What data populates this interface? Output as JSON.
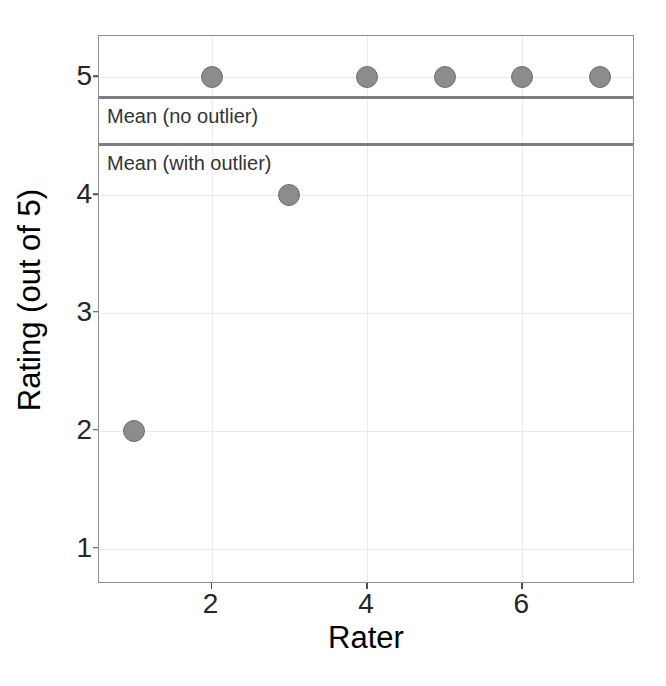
{
  "chart_data": {
    "type": "scatter",
    "title": "",
    "xlabel": "Rater",
    "ylabel": "Rating (out of 5)",
    "x": [
      1,
      2,
      3,
      4,
      5,
      6,
      7
    ],
    "values": [
      2,
      5,
      4,
      5,
      5,
      5,
      5
    ],
    "series": [
      {
        "name": "Ratings",
        "x": [
          1,
          2,
          3,
          4,
          5,
          6,
          7
        ],
        "values": [
          2,
          5,
          4,
          5,
          5,
          5,
          5
        ]
      }
    ],
    "xlim": [
      0.55,
      7.45
    ],
    "ylim": [
      0.7,
      5.35
    ],
    "xticks": [
      2,
      4,
      6
    ],
    "xtick_labels": [
      "2",
      "4",
      "6"
    ],
    "yticks": [
      1,
      2,
      3,
      4,
      5
    ],
    "ytick_labels": [
      "1",
      "2",
      "3",
      "4",
      "5"
    ],
    "grid": true,
    "legend": "none",
    "point_color": "#8c8c8c",
    "point_stroke": "#6e6e6e",
    "gridline_color": "#ebebeb",
    "panel_border_color": "#8f8f8f",
    "reference_line_color": "#7f7f7f",
    "annotations": [
      {
        "id": "mean-no-outlier",
        "label": "Mean (no outlier)",
        "y": 4.83,
        "type": "hline"
      },
      {
        "id": "mean-with-outlier",
        "label": "Mean (with outlier)",
        "y": 4.43,
        "type": "hline"
      }
    ]
  }
}
